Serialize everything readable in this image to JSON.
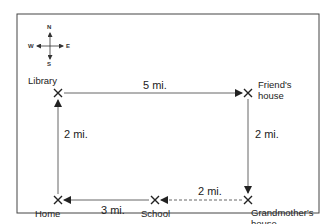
{
  "diagram": {
    "compass": {
      "north": "N",
      "south": "S",
      "east": "E",
      "west": "W"
    },
    "locations": {
      "library": "Library",
      "friends_house_1": "Friend's",
      "friends_house_2": "house",
      "grandmothers_house_1": "Grandmother's",
      "grandmothers_house_2": "house",
      "school": "School",
      "home": "Home"
    },
    "distances": {
      "library_to_friend": "5 mi.",
      "friend_to_grandmother": "2 mi.",
      "grandmother_to_school": "2 mi.",
      "school_to_home": "3 mi.",
      "home_to_library": "2 mi."
    },
    "colors": {
      "line": "#555555",
      "frame": "#444444",
      "text": "#222222"
    }
  }
}
